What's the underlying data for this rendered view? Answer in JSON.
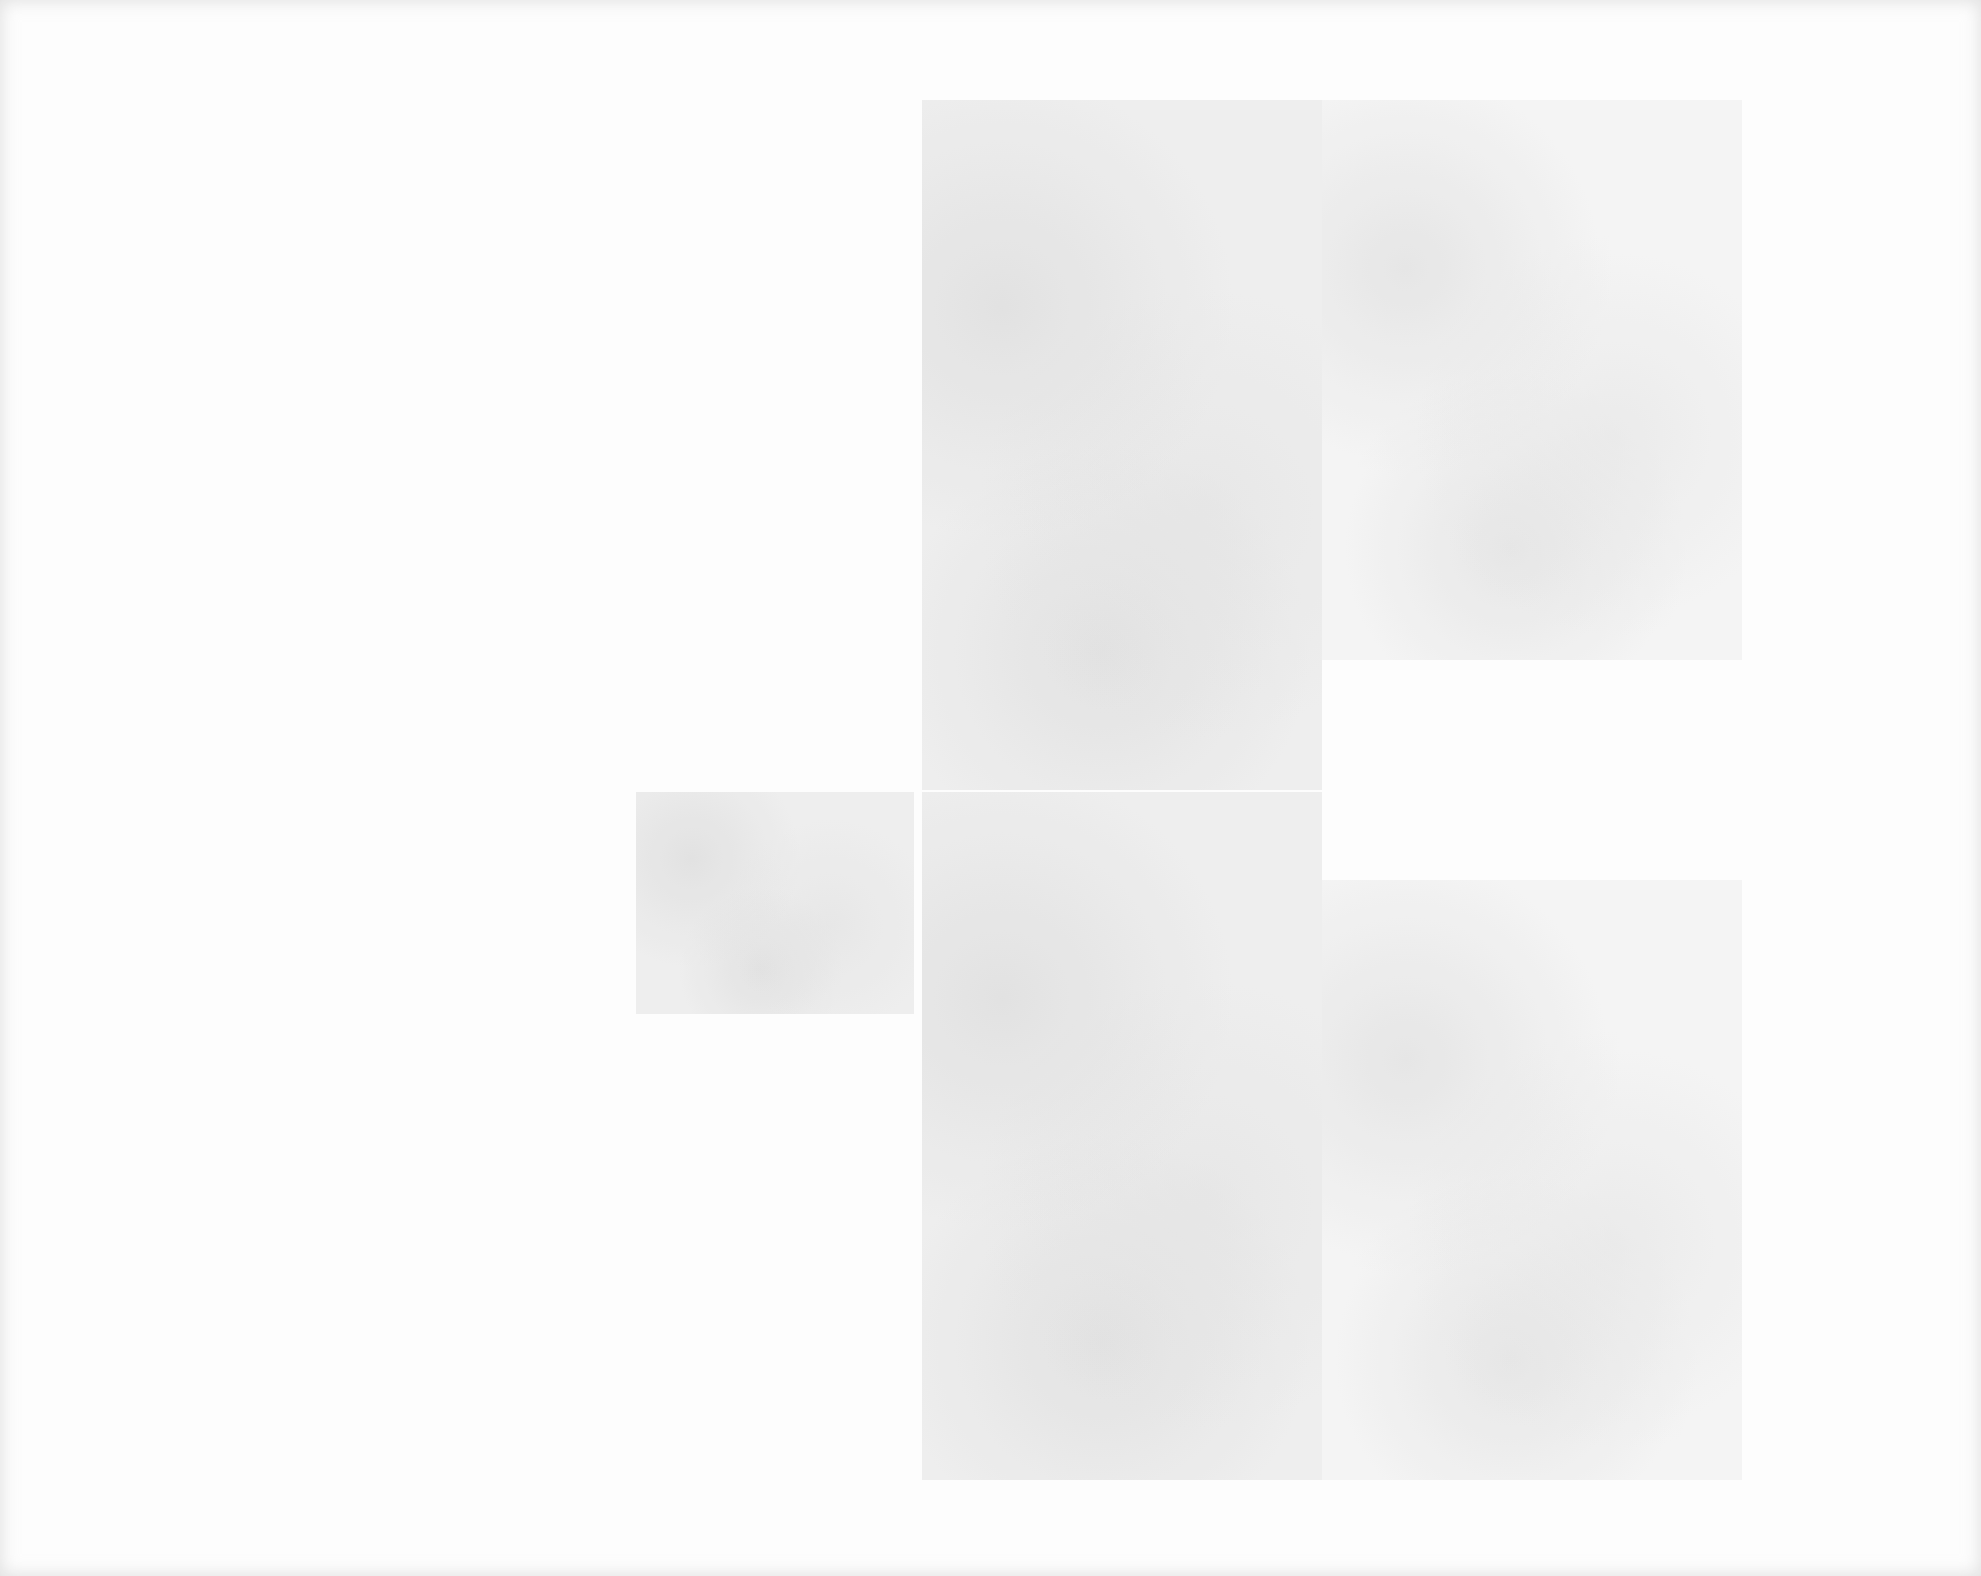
{
  "page": {
    "background_color": "#fdfdfd",
    "block_color": "#ececec",
    "blocks": [
      {
        "name": "upper-block-main",
        "left": 922,
        "top": 100,
        "width": 400,
        "height": 690
      },
      {
        "name": "upper-block-right",
        "left": 1322,
        "top": 100,
        "width": 420,
        "height": 560
      },
      {
        "name": "small-left-block",
        "left": 636,
        "top": 792,
        "width": 278,
        "height": 222
      },
      {
        "name": "lower-block-main",
        "left": 922,
        "top": 792,
        "width": 400,
        "height": 688
      },
      {
        "name": "lower-block-right",
        "left": 1322,
        "top": 880,
        "width": 420,
        "height": 600
      }
    ]
  }
}
